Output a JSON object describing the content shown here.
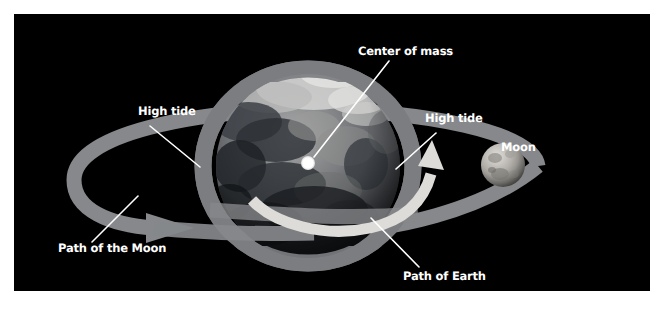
{
  "figure": {
    "background_color": "#000000",
    "frame_color": "#ffffff",
    "label_color": "#ffffff"
  },
  "labels": {
    "center_of_mass": "Center of mass",
    "high_tide_left": "High tide",
    "high_tide_right": "High tide",
    "moon": "Moon",
    "path_of_moon": "Path of the Moon",
    "path_of_earth": "Path of Earth"
  },
  "objects": {
    "earth": {
      "name": "Earth",
      "cx": 294,
      "cy": 152,
      "r": 92,
      "colors": [
        "#b9b9b9",
        "#8d8d8d",
        "#5a5a5a",
        "#2f3236",
        "#141619"
      ]
    },
    "moon": {
      "name": "Moon",
      "cx": 489,
      "cy": 151,
      "r": 22,
      "colors": [
        "#d6d4d0",
        "#a3a09b",
        "#6d6b67"
      ]
    },
    "center_of_mass_dot": {
      "name": "Center of mass marker",
      "cx": 294,
      "cy": 149,
      "r": 7,
      "color": "#ffffff"
    },
    "tidal_bulge_ellipse": {
      "name": "Tidal bulge ellipse",
      "cx": 294,
      "cy": 152,
      "rx": 105,
      "ry": 97,
      "stroke_width": 17,
      "color": "#7b7d80"
    },
    "moon_orbit_band": {
      "name": "Path of the Moon band",
      "color": "#86888b",
      "band_width": 15
    },
    "earth_orbit_arc": {
      "name": "Path of Earth arc",
      "color": "#dedcd8"
    }
  },
  "pointer_lines": [
    {
      "name": "center-of-mass-pointer",
      "x1": 375,
      "y1": 47,
      "x2": 300,
      "y2": 143
    },
    {
      "name": "high-tide-left-pointer",
      "x1": 136,
      "y1": 112,
      "x2": 185,
      "y2": 152
    },
    {
      "name": "high-tide-right-pointer",
      "x1": 422,
      "y1": 119,
      "x2": 383,
      "y2": 154
    },
    {
      "name": "path-of-moon-pointer",
      "x1": 78,
      "y1": 228,
      "x2": 122,
      "y2": 182
    },
    {
      "name": "path-of-earth-pointer",
      "x1": 405,
      "y1": 253,
      "x2": 358,
      "y2": 205
    }
  ]
}
